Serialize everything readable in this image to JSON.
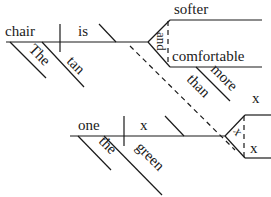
{
  "diagram": {
    "type": "Reed-Kellogg sentence diagram",
    "clause_main": {
      "subject": "chair",
      "subject_modifiers": [
        "The",
        "tan"
      ],
      "verb": "is",
      "conjunction": "and",
      "complements": [
        "softer",
        "comfortable"
      ],
      "complement_modifier": "more",
      "connector": "than",
      "elided_word": "x"
    },
    "clause_sub": {
      "subject": "one",
      "subject_modifiers": [
        "the",
        "green"
      ],
      "verb": "x",
      "conjunction": "x",
      "complements": [
        "x",
        "x"
      ]
    }
  }
}
